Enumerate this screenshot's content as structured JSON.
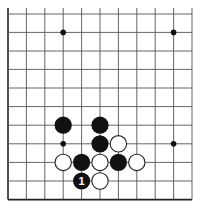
{
  "diagram": {
    "type": "go-board-fragment",
    "grid": {
      "columns_x": [
        8,
        26.4,
        44.8,
        63.2,
        81.6,
        100,
        118.4,
        136.8,
        155.2,
        173.6,
        192
      ],
      "rows_y": [
        14,
        32.4,
        51,
        69.4,
        88,
        106.6,
        125.2,
        143.8,
        162.4,
        181,
        199.6
      ],
      "left_edge": true,
      "bottom_edge": true,
      "top_open": true,
      "right_open": true,
      "line_color": "#555555",
      "edge_color": "#222222"
    },
    "star_points": [
      {
        "col": 3,
        "row": 1
      },
      {
        "col": 9,
        "row": 1
      },
      {
        "col": 3,
        "row": 7
      },
      {
        "col": 9,
        "row": 7
      }
    ],
    "stones": [
      {
        "color": "black",
        "col": 3,
        "row": 6,
        "label": ""
      },
      {
        "color": "black",
        "col": 5,
        "row": 6,
        "label": ""
      },
      {
        "color": "black",
        "col": 5,
        "row": 7,
        "label": ""
      },
      {
        "color": "white",
        "col": 6,
        "row": 7,
        "label": ""
      },
      {
        "color": "white",
        "col": 3,
        "row": 8,
        "label": ""
      },
      {
        "color": "black",
        "col": 4,
        "row": 8,
        "label": ""
      },
      {
        "color": "white",
        "col": 5,
        "row": 8,
        "label": ""
      },
      {
        "color": "black",
        "col": 6,
        "row": 8,
        "label": ""
      },
      {
        "color": "white",
        "col": 7,
        "row": 8,
        "label": ""
      },
      {
        "color": "black",
        "col": 4,
        "row": 9,
        "label": "1"
      },
      {
        "color": "white",
        "col": 5,
        "row": 9,
        "label": ""
      }
    ]
  }
}
